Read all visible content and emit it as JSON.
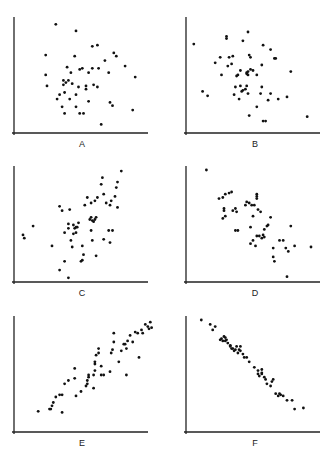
{
  "chart_data": [
    {
      "type": "scatter",
      "title": "",
      "label": "A",
      "description": "No correlation",
      "xlabel": "",
      "ylabel": "",
      "xlim": [
        0,
        100
      ],
      "ylim": [
        0,
        100
      ],
      "grid": false,
      "points": [
        [
          30,
          97
        ],
        [
          46,
          91
        ],
        [
          22,
          69
        ],
        [
          45,
          68
        ],
        [
          59,
          77
        ],
        [
          63,
          78
        ],
        [
          69,
          64
        ],
        [
          76,
          71
        ],
        [
          78,
          68
        ],
        [
          22,
          51
        ],
        [
          39,
          58
        ],
        [
          49,
          56
        ],
        [
          51,
          57
        ],
        [
          56,
          53
        ],
        [
          59,
          57
        ],
        [
          64,
          57
        ],
        [
          72,
          53
        ],
        [
          85,
          59
        ],
        [
          93,
          49
        ],
        [
          23,
          41
        ],
        [
          36,
          46
        ],
        [
          36,
          42
        ],
        [
          40,
          46
        ],
        [
          43,
          43
        ],
        [
          48,
          40
        ],
        [
          54,
          41
        ],
        [
          54,
          38
        ],
        [
          60,
          42
        ],
        [
          63,
          40
        ],
        [
          37,
          35
        ],
        [
          33,
          33
        ],
        [
          31,
          29
        ],
        [
          41,
          29
        ],
        [
          46,
          33
        ],
        [
          35,
          22
        ],
        [
          46,
          22
        ],
        [
          56,
          27
        ],
        [
          73,
          26
        ],
        [
          75,
          23
        ],
        [
          91,
          19
        ],
        [
          37,
          16
        ],
        [
          49,
          16
        ],
        [
          52,
          16
        ],
        [
          66,
          6
        ],
        [
          38,
          44
        ],
        [
          42,
          53
        ]
      ]
    },
    {
      "type": "scatter",
      "title": "",
      "label": "B",
      "description": "No / weak correlation",
      "xlabel": "",
      "ylabel": "",
      "xlim": [
        0,
        100
      ],
      "ylim": [
        0,
        100
      ],
      "grid": false,
      "points": [
        [
          3,
          79
        ],
        [
          46,
          90
        ],
        [
          29,
          84
        ],
        [
          29,
          86
        ],
        [
          42,
          82
        ],
        [
          58,
          78
        ],
        [
          64,
          74
        ],
        [
          67,
          66
        ],
        [
          68,
          66
        ],
        [
          24,
          67
        ],
        [
          31,
          67
        ],
        [
          34,
          68
        ],
        [
          47,
          69
        ],
        [
          48,
          67
        ],
        [
          20,
          62
        ],
        [
          30,
          59
        ],
        [
          33,
          61
        ],
        [
          40,
          55
        ],
        [
          50,
          55
        ],
        [
          57,
          60
        ],
        [
          25,
          51
        ],
        [
          37,
          50
        ],
        [
          38,
          51
        ],
        [
          45,
          53
        ],
        [
          45,
          52
        ],
        [
          46,
          54
        ],
        [
          48,
          56
        ],
        [
          46,
          51
        ],
        [
          53,
          51
        ],
        [
          80,
          54
        ],
        [
          10,
          36
        ],
        [
          14,
          32
        ],
        [
          36,
          40
        ],
        [
          40,
          41
        ],
        [
          41,
          36
        ],
        [
          42,
          37
        ],
        [
          44,
          38
        ],
        [
          46,
          34
        ],
        [
          35,
          33
        ],
        [
          45,
          41
        ],
        [
          57,
          40
        ],
        [
          39,
          29
        ],
        [
          56,
          34
        ],
        [
          64,
          34
        ],
        [
          62,
          28
        ],
        [
          70,
          29
        ],
        [
          77,
          31
        ],
        [
          53,
          22
        ],
        [
          47,
          14
        ],
        [
          58,
          9
        ],
        [
          60,
          9
        ],
        [
          93,
          13
        ]
      ]
    },
    {
      "type": "scatter",
      "title": "",
      "label": "C",
      "description": "Moderate positive correlation",
      "xlabel": "",
      "ylabel": "",
      "xlim": [
        0,
        100
      ],
      "ylim": [
        0,
        100
      ],
      "grid": false,
      "points": [
        [
          4,
          41
        ],
        [
          5,
          38
        ],
        [
          12,
          49
        ],
        [
          27,
          31
        ],
        [
          33,
          67
        ],
        [
          35,
          63
        ],
        [
          41,
          64
        ],
        [
          40,
          51
        ],
        [
          37,
          43
        ],
        [
          40,
          47
        ],
        [
          45,
          47
        ],
        [
          46,
          43
        ],
        [
          46,
          48
        ],
        [
          44,
          50
        ],
        [
          47,
          48
        ],
        [
          48,
          52
        ],
        [
          42,
          36
        ],
        [
          44,
          42
        ],
        [
          43,
          30
        ],
        [
          51,
          31
        ],
        [
          52,
          23
        ],
        [
          51,
          18
        ],
        [
          50,
          17
        ],
        [
          37,
          17
        ],
        [
          33,
          9
        ],
        [
          40,
          2
        ],
        [
          53,
          68
        ],
        [
          55,
          75
        ],
        [
          58,
          70
        ],
        [
          57,
          55
        ],
        [
          58,
          57
        ],
        [
          59,
          54
        ],
        [
          60,
          53
        ],
        [
          61,
          55
        ],
        [
          62,
          57
        ],
        [
          58,
          45
        ],
        [
          61,
          72
        ],
        [
          63,
          75
        ],
        [
          59,
          36
        ],
        [
          62,
          22
        ],
        [
          68,
          37
        ],
        [
          73,
          34
        ],
        [
          72,
          45
        ],
        [
          75,
          45
        ],
        [
          66,
          87
        ],
        [
          67,
          93
        ],
        [
          68,
          78
        ],
        [
          70,
          70
        ],
        [
          73,
          68
        ],
        [
          74,
          72
        ],
        [
          77,
          76
        ],
        [
          78,
          84
        ],
        [
          79,
          66
        ],
        [
          79,
          89
        ],
        [
          82,
          99
        ]
      ]
    },
    {
      "type": "scatter",
      "title": "",
      "label": "D",
      "description": "Moderate negative correlation",
      "xlabel": "",
      "ylabel": "",
      "xlim": [
        0,
        100
      ],
      "ylim": [
        0,
        100
      ],
      "grid": false,
      "points": [
        [
          13,
          100
        ],
        [
          23,
          74
        ],
        [
          26,
          75
        ],
        [
          28,
          78
        ],
        [
          31,
          79
        ],
        [
          33,
          80
        ],
        [
          27,
          65
        ],
        [
          27,
          63
        ],
        [
          26,
          56
        ],
        [
          28,
          58
        ],
        [
          34,
          63
        ],
        [
          36,
          65
        ],
        [
          37,
          62
        ],
        [
          44,
          68
        ],
        [
          45,
          71
        ],
        [
          47,
          70
        ],
        [
          49,
          68
        ],
        [
          51,
          68
        ],
        [
          53,
          78
        ],
        [
          53,
          76
        ],
        [
          53,
          74
        ],
        [
          50,
          58
        ],
        [
          54,
          64
        ],
        [
          56,
          62
        ],
        [
          36,
          45
        ],
        [
          38,
          45
        ],
        [
          48,
          48
        ],
        [
          53,
          40
        ],
        [
          55,
          40
        ],
        [
          58,
          41
        ],
        [
          59,
          46
        ],
        [
          61,
          49
        ],
        [
          48,
          33
        ],
        [
          50,
          36
        ],
        [
          52,
          31
        ],
        [
          57,
          38
        ],
        [
          59,
          39
        ],
        [
          62,
          50
        ],
        [
          64,
          57
        ],
        [
          66,
          29
        ],
        [
          66,
          21
        ],
        [
          67,
          17
        ],
        [
          71,
          36
        ],
        [
          74,
          36
        ],
        [
          76,
          29
        ],
        [
          78,
          26
        ],
        [
          80,
          49
        ],
        [
          83,
          31
        ],
        [
          96,
          30
        ],
        [
          77,
          3
        ]
      ]
    },
    {
      "type": "scatter",
      "title": "",
      "label": "E",
      "description": "Strong positive correlation",
      "xlabel": "",
      "ylabel": "",
      "xlim": [
        0,
        100
      ],
      "ylim": [
        0,
        100
      ],
      "grid": false,
      "points": [
        [
          16,
          17
        ],
        [
          25,
          19
        ],
        [
          26,
          19
        ],
        [
          27,
          22
        ],
        [
          28,
          25
        ],
        [
          35,
          16
        ],
        [
          30,
          30
        ],
        [
          33,
          32
        ],
        [
          35,
          32
        ],
        [
          37,
          42
        ],
        [
          40,
          45
        ],
        [
          45,
          47
        ],
        [
          46,
          31
        ],
        [
          45,
          56
        ],
        [
          50,
          35
        ],
        [
          54,
          40
        ],
        [
          55,
          42
        ],
        [
          55,
          45
        ],
        [
          56,
          48
        ],
        [
          56,
          50
        ],
        [
          60,
          38
        ],
        [
          60,
          50
        ],
        [
          61,
          54
        ],
        [
          61,
          60
        ],
        [
          61,
          62
        ],
        [
          62,
          68
        ],
        [
          64,
          70
        ],
        [
          64,
          74
        ],
        [
          66,
          58
        ],
        [
          66,
          50
        ],
        [
          68,
          50
        ],
        [
          73,
          53
        ],
        [
          74,
          70
        ],
        [
          75,
          73
        ],
        [
          76,
          80
        ],
        [
          76,
          88
        ],
        [
          80,
          62
        ],
        [
          82,
          72
        ],
        [
          84,
          78
        ],
        [
          85,
          78
        ],
        [
          86,
          74
        ],
        [
          87,
          81
        ],
        [
          86,
          50
        ],
        [
          89,
          86
        ],
        [
          91,
          80
        ],
        [
          93,
          89
        ],
        [
          95,
          88
        ],
        [
          96,
          66
        ],
        [
          98,
          91
        ],
        [
          99,
          88
        ],
        [
          101,
          96
        ],
        [
          103,
          94
        ],
        [
          104,
          92
        ],
        [
          105,
          98
        ],
        [
          106,
          93
        ]
      ]
    },
    {
      "type": "scatter",
      "title": "",
      "label": "F",
      "description": "Very strong negative correlation",
      "xlabel": "",
      "ylabel": "",
      "xlim": [
        0,
        100
      ],
      "ylim": [
        0,
        100
      ],
      "grid": false,
      "points": [
        [
          9,
          100
        ],
        [
          16,
          96
        ],
        [
          18,
          91
        ],
        [
          20,
          94
        ],
        [
          24,
          82
        ],
        [
          25,
          83
        ],
        [
          26,
          81
        ],
        [
          27,
          85
        ],
        [
          28,
          81
        ],
        [
          28,
          84
        ],
        [
          29,
          82
        ],
        [
          30,
          79
        ],
        [
          32,
          77
        ],
        [
          32,
          76
        ],
        [
          33,
          74
        ],
        [
          34,
          74
        ],
        [
          35,
          72
        ],
        [
          36,
          73
        ],
        [
          37,
          76
        ],
        [
          38,
          70
        ],
        [
          39,
          73
        ],
        [
          40,
          76
        ],
        [
          40,
          72
        ],
        [
          42,
          69
        ],
        [
          43,
          66
        ],
        [
          45,
          66
        ],
        [
          47,
          62
        ],
        [
          51,
          57
        ],
        [
          54,
          54
        ],
        [
          54,
          51
        ],
        [
          55,
          49
        ],
        [
          57,
          52
        ],
        [
          57,
          55
        ],
        [
          57,
          51
        ],
        [
          59,
          48
        ],
        [
          60,
          46
        ],
        [
          61,
          42
        ],
        [
          64,
          40
        ],
        [
          65,
          44
        ],
        [
          66,
          46
        ],
        [
          68,
          33
        ],
        [
          70,
          31
        ],
        [
          71,
          33
        ],
        [
          72,
          32
        ],
        [
          74,
          31
        ],
        [
          77,
          27
        ],
        [
          81,
          27
        ],
        [
          83,
          19
        ],
        [
          90,
          20
        ]
      ]
    }
  ],
  "panels": [
    {
      "label": "A"
    },
    {
      "label": "B"
    },
    {
      "label": "C"
    },
    {
      "label": "D"
    },
    {
      "label": "E"
    },
    {
      "label": "F"
    }
  ]
}
